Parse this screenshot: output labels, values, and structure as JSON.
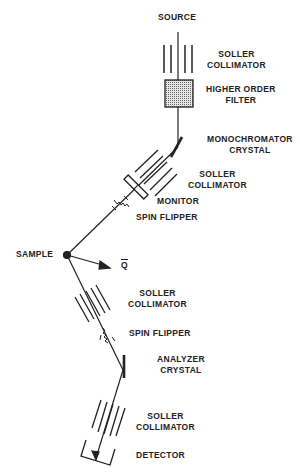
{
  "diagram": {
    "type": "neutron triple-axis spectrometer schematic",
    "labels": {
      "source": "SOURCE",
      "soller_collimator_1": [
        "SOLLER",
        "COLLIMATOR"
      ],
      "higher_order_filter": [
        "HIGHER ORDER",
        "FILTER"
      ],
      "monochromator_crystal": [
        "MONOCHROMATOR",
        "CRYSTAL"
      ],
      "soller_collimator_2": [
        "SOLLER",
        "COLLIMATOR"
      ],
      "monitor": "MONITOR",
      "spin_flipper_1": "SPIN FLIPPER",
      "sample": "SAMPLE",
      "q_vector": "Q",
      "soller_collimator_3": [
        "SOLLER",
        "COLLIMATOR"
      ],
      "spin_flipper_2": "SPIN FLIPPER",
      "analyzer_crystal": [
        "ANALYZER",
        "CRYSTAL"
      ],
      "soller_collimator_4": [
        "SOLLER",
        "COLLIMATOR"
      ],
      "detector": "DETECTOR"
    },
    "colors": {
      "line": "#222222",
      "filter_fill": "#bdbdbd",
      "background": "#ffffff"
    }
  }
}
